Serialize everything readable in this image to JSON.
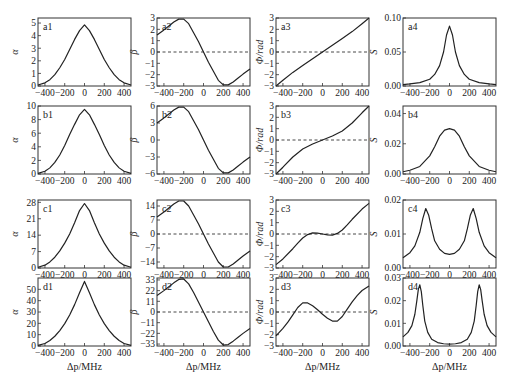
{
  "figure": {
    "xlabel": "Δp/MHz",
    "x_ticks": [
      -400,
      -200,
      0,
      200,
      400
    ],
    "x_tick_labels": [
      "−400",
      "−200",
      "0",
      "200",
      "400"
    ],
    "xlim": [
      -470,
      470
    ],
    "line_color": "#222222",
    "dash_color": "#333333"
  },
  "chart_data": [
    {
      "id": "a1",
      "type": "line",
      "row": 0,
      "col": 0,
      "label": "a1",
      "ylabel": "α",
      "ylim": [
        0,
        5.4
      ],
      "y_ticks": [
        0,
        1,
        2,
        3,
        4,
        5
      ],
      "y_tick_labels": [
        "0",
        "1",
        "2",
        "3",
        "4",
        "5"
      ],
      "zero_line": false,
      "x": [
        -470,
        -400,
        -350,
        -300,
        -250,
        -200,
        -150,
        -100,
        -50,
        0,
        50,
        100,
        150,
        200,
        250,
        300,
        350,
        400,
        470
      ],
      "y": [
        0.08,
        0.25,
        0.5,
        0.9,
        1.45,
        2.1,
        2.9,
        3.7,
        4.4,
        4.85,
        4.4,
        3.7,
        2.9,
        2.1,
        1.45,
        0.9,
        0.5,
        0.25,
        0.08
      ]
    },
    {
      "id": "a2",
      "type": "line",
      "row": 0,
      "col": 1,
      "label": "a2",
      "ylabel": "β",
      "ylim": [
        -3,
        3
      ],
      "y_ticks": [
        -3,
        -2,
        -1,
        0,
        1,
        2,
        3
      ],
      "y_tick_labels": [
        "−3",
        "−2",
        "−1",
        "0",
        "1",
        "2",
        "3"
      ],
      "zero_line": true,
      "x": [
        -470,
        -400,
        -350,
        -300,
        -250,
        -200,
        -150,
        -100,
        -50,
        0,
        50,
        100,
        150,
        200,
        250,
        300,
        350,
        400,
        470
      ],
      "y": [
        1.5,
        1.95,
        2.3,
        2.65,
        2.9,
        2.9,
        2.5,
        1.7,
        0.9,
        0.0,
        -0.9,
        -1.7,
        -2.5,
        -2.9,
        -2.9,
        -2.65,
        -2.3,
        -1.95,
        -1.5
      ]
    },
    {
      "id": "a3",
      "type": "line",
      "row": 0,
      "col": 2,
      "label": "a3",
      "ylabel": "Φ/rad",
      "ylim": [
        -3,
        3
      ],
      "y_ticks": [
        -3,
        -2,
        -1,
        0,
        1,
        2,
        3
      ],
      "y_tick_labels": [
        "−3",
        "−2",
        "−1",
        "0",
        "1",
        "2",
        "3"
      ],
      "zero_line": true,
      "x": [
        -470,
        -400,
        -300,
        -200,
        -100,
        0,
        100,
        200,
        300,
        400,
        470
      ],
      "y": [
        -3.0,
        -2.5,
        -1.8,
        -1.2,
        -0.6,
        0.0,
        0.6,
        1.2,
        1.8,
        2.5,
        3.0
      ]
    },
    {
      "id": "a4",
      "type": "line",
      "row": 0,
      "col": 3,
      "label": "a4",
      "ylabel": "S",
      "ylim": [
        0,
        0.1
      ],
      "y_ticks": [
        0,
        0.05,
        0.1
      ],
      "y_tick_labels": [
        "0.00",
        "0.05",
        "0.10"
      ],
      "zero_line": false,
      "x": [
        -470,
        -400,
        -300,
        -200,
        -150,
        -100,
        -60,
        -30,
        0,
        30,
        60,
        100,
        150,
        200,
        300,
        400,
        470
      ],
      "y": [
        0.002,
        0.003,
        0.005,
        0.01,
        0.017,
        0.03,
        0.05,
        0.075,
        0.088,
        0.075,
        0.05,
        0.03,
        0.017,
        0.01,
        0.005,
        0.003,
        0.002
      ]
    },
    {
      "id": "b1",
      "type": "line",
      "row": 1,
      "col": 0,
      "label": "b1",
      "ylabel": "α",
      "ylim": [
        0,
        10
      ],
      "y_ticks": [
        0,
        2,
        4,
        6,
        8,
        10
      ],
      "y_tick_labels": [
        "0",
        "2",
        "4",
        "6",
        "8",
        "10"
      ],
      "zero_line": false,
      "x": [
        -470,
        -400,
        -350,
        -300,
        -250,
        -200,
        -150,
        -100,
        -50,
        0,
        50,
        100,
        150,
        200,
        250,
        300,
        350,
        400,
        470
      ],
      "y": [
        0.1,
        0.4,
        0.9,
        1.7,
        2.8,
        4.2,
        5.8,
        7.3,
        8.7,
        9.5,
        8.7,
        7.3,
        5.8,
        4.2,
        2.8,
        1.7,
        0.9,
        0.4,
        0.1
      ]
    },
    {
      "id": "b2",
      "type": "line",
      "row": 1,
      "col": 1,
      "label": "b2",
      "ylabel": "β",
      "ylim": [
        -6,
        6
      ],
      "y_ticks": [
        -6,
        -3,
        0,
        3,
        6
      ],
      "y_tick_labels": [
        "−6",
        "−3",
        "0",
        "3",
        "6"
      ],
      "zero_line": false,
      "x": [
        -470,
        -400,
        -350,
        -300,
        -250,
        -200,
        -150,
        -100,
        -50,
        0,
        50,
        100,
        150,
        200,
        250,
        300,
        350,
        400,
        470
      ],
      "y": [
        3.0,
        3.9,
        4.6,
        5.3,
        5.8,
        5.8,
        5.0,
        3.4,
        1.8,
        0.0,
        -1.8,
        -3.4,
        -5.0,
        -5.8,
        -5.8,
        -5.3,
        -4.6,
        -3.9,
        -3.0
      ]
    },
    {
      "id": "b3",
      "type": "line",
      "row": 1,
      "col": 2,
      "label": "b3",
      "ylabel": "Φ/rad",
      "ylim": [
        -3,
        3
      ],
      "y_ticks": [
        -3,
        -2,
        -1,
        0,
        1,
        2,
        3
      ],
      "y_tick_labels": [
        "−3",
        "−2",
        "−1",
        "0",
        "1",
        "2",
        "3"
      ],
      "zero_line": true,
      "x": [
        -470,
        -400,
        -300,
        -200,
        -100,
        0,
        100,
        200,
        300,
        400,
        470
      ],
      "y": [
        -3.0,
        -2.4,
        -1.5,
        -0.8,
        -0.35,
        0.0,
        0.35,
        0.8,
        1.5,
        2.4,
        3.0
      ]
    },
    {
      "id": "b4",
      "type": "line",
      "row": 1,
      "col": 3,
      "label": "b4",
      "ylabel": "S",
      "ylim": [
        0,
        0.045
      ],
      "y_ticks": [
        0,
        0.02,
        0.04
      ],
      "y_tick_labels": [
        "0.00",
        "0.02",
        "0.04"
      ],
      "zero_line": false,
      "x": [
        -470,
        -400,
        -300,
        -200,
        -150,
        -100,
        -50,
        0,
        50,
        100,
        150,
        200,
        300,
        400,
        470
      ],
      "y": [
        0.0015,
        0.0025,
        0.005,
        0.012,
        0.018,
        0.025,
        0.029,
        0.03,
        0.029,
        0.025,
        0.018,
        0.012,
        0.005,
        0.0025,
        0.0015
      ]
    },
    {
      "id": "c1",
      "type": "line",
      "row": 2,
      "col": 0,
      "label": "c1",
      "ylabel": "α",
      "ylim": [
        0,
        29
      ],
      "y_ticks": [
        0,
        7,
        14,
        21,
        28
      ],
      "y_tick_labels": [
        "0",
        "7",
        "14",
        "21",
        "28"
      ],
      "zero_line": false,
      "x": [
        -470,
        -400,
        -350,
        -300,
        -250,
        -200,
        -150,
        -100,
        -50,
        0,
        50,
        100,
        150,
        200,
        250,
        300,
        350,
        400,
        470
      ],
      "y": [
        0.3,
        1.2,
        2.6,
        4.6,
        7.3,
        10.6,
        14.5,
        19.3,
        24.5,
        27.5,
        24.5,
        19.3,
        14.5,
        10.6,
        7.3,
        4.6,
        2.6,
        1.2,
        0.3
      ]
    },
    {
      "id": "c2",
      "type": "line",
      "row": 2,
      "col": 1,
      "label": "c2",
      "ylabel": "β",
      "ylim": [
        -17,
        17
      ],
      "y_ticks": [
        -14,
        -7,
        0,
        7,
        14
      ],
      "y_tick_labels": [
        "−14",
        "−7",
        "0",
        "7",
        "14"
      ],
      "zero_line": true,
      "x": [
        -470,
        -400,
        -350,
        -300,
        -250,
        -200,
        -150,
        -100,
        -50,
        0,
        50,
        100,
        150,
        200,
        250,
        300,
        350,
        400,
        470
      ],
      "y": [
        8.5,
        11,
        13,
        15,
        16.5,
        16.5,
        14,
        9.5,
        5,
        0,
        -5,
        -9.5,
        -14,
        -16.5,
        -16.5,
        -15,
        -13,
        -11,
        -8.5
      ]
    },
    {
      "id": "c3",
      "type": "line",
      "row": 2,
      "col": 2,
      "label": "c3",
      "ylabel": "Φ/rad",
      "ylim": [
        -3,
        3
      ],
      "y_ticks": [
        -3,
        -2,
        -1,
        0,
        1,
        2,
        3
      ],
      "y_tick_labels": [
        "−3",
        "−2",
        "−1",
        "0",
        "1",
        "2",
        "3"
      ],
      "zero_line": true,
      "x": [
        -470,
        -400,
        -300,
        -250,
        -200,
        -150,
        -100,
        -50,
        0,
        50,
        100,
        150,
        200,
        250,
        300,
        400,
        470
      ],
      "y": [
        -2.7,
        -2.2,
        -1.3,
        -0.8,
        -0.35,
        -0.05,
        0.1,
        0.08,
        0.0,
        -0.08,
        -0.1,
        0.05,
        0.35,
        0.8,
        1.3,
        2.2,
        2.7
      ]
    },
    {
      "id": "c4",
      "type": "line",
      "row": 2,
      "col": 3,
      "label": "c4",
      "ylabel": "S",
      "ylim": [
        0,
        0.02
      ],
      "y_ticks": [
        0,
        0.01,
        0.02
      ],
      "y_tick_labels": [
        "0.00",
        "0.01",
        "0.02"
      ],
      "zero_line": false,
      "x": [
        -470,
        -400,
        -350,
        -300,
        -270,
        -240,
        -210,
        -180,
        -150,
        -100,
        -50,
        0,
        50,
        100,
        150,
        180,
        210,
        240,
        270,
        300,
        350,
        400,
        470
      ],
      "y": [
        0.003,
        0.0045,
        0.0065,
        0.0105,
        0.0145,
        0.0175,
        0.0155,
        0.0115,
        0.008,
        0.0055,
        0.0043,
        0.004,
        0.0043,
        0.0055,
        0.008,
        0.0115,
        0.0155,
        0.0175,
        0.0145,
        0.0105,
        0.0065,
        0.0045,
        0.003
      ]
    },
    {
      "id": "d1",
      "type": "line",
      "row": 3,
      "col": 0,
      "label": "d1",
      "ylabel": "α",
      "ylim": [
        0,
        60
      ],
      "y_ticks": [
        0,
        10,
        20,
        30,
        40,
        50
      ],
      "y_tick_labels": [
        "0",
        "10",
        "20",
        "30",
        "40",
        "50"
      ],
      "zero_line": false,
      "x": [
        -470,
        -400,
        -350,
        -300,
        -250,
        -200,
        -150,
        -100,
        -50,
        0,
        50,
        100,
        150,
        200,
        250,
        300,
        350,
        400,
        470
      ],
      "y": [
        0.5,
        2.2,
        4.8,
        8.6,
        13.6,
        19.7,
        27.3,
        36.5,
        47,
        57,
        47,
        36.5,
        27.3,
        19.7,
        13.6,
        8.6,
        4.8,
        2.2,
        0.5
      ]
    },
    {
      "id": "d2",
      "type": "line",
      "row": 3,
      "col": 1,
      "label": "d2",
      "ylabel": "β",
      "ylim": [
        -35,
        35
      ],
      "y_ticks": [
        -33,
        -22,
        -11,
        0,
        11,
        22,
        33
      ],
      "y_tick_labels": [
        "−33",
        "−22",
        "−11",
        "0",
        "11",
        "22",
        "33"
      ],
      "zero_line": true,
      "x": [
        -470,
        -400,
        -350,
        -300,
        -250,
        -200,
        -150,
        -100,
        -50,
        0,
        50,
        100,
        150,
        200,
        250,
        300,
        350,
        400,
        470
      ],
      "y": [
        17,
        22,
        26,
        30,
        33.5,
        34,
        29,
        20,
        10,
        0,
        -10,
        -20,
        -29,
        -34,
        -33.5,
        -30,
        -26,
        -22,
        -17
      ]
    },
    {
      "id": "d3",
      "type": "line",
      "row": 3,
      "col": 2,
      "label": "d3",
      "ylabel": "Φ/rad",
      "ylim": [
        -3,
        3
      ],
      "y_ticks": [
        -3,
        -2,
        -1,
        0,
        1,
        2,
        3
      ],
      "y_tick_labels": [
        "−3",
        "−2",
        "−1",
        "0",
        "1",
        "2",
        "3"
      ],
      "zero_line": true,
      "x": [
        -470,
        -400,
        -350,
        -300,
        -250,
        -200,
        -150,
        -100,
        -50,
        0,
        50,
        100,
        150,
        200,
        250,
        300,
        350,
        400,
        470
      ],
      "y": [
        -2.1,
        -1.45,
        -0.9,
        -0.25,
        0.4,
        0.8,
        0.8,
        0.55,
        0.2,
        -0.2,
        -0.55,
        -0.8,
        -0.8,
        -0.4,
        0.25,
        0.9,
        1.45,
        1.9,
        2.3
      ]
    },
    {
      "id": "d4",
      "type": "line",
      "row": 3,
      "col": 3,
      "label": "d4",
      "ylabel": "S",
      "ylim": [
        0,
        0.03
      ],
      "y_ticks": [
        0,
        0.01,
        0.02,
        0.03
      ],
      "y_tick_labels": [
        "0.00",
        "0.01",
        "0.02",
        "0.03"
      ],
      "zero_line": false,
      "x": [
        -470,
        -420,
        -380,
        -350,
        -330,
        -315,
        -300,
        -285,
        -270,
        -250,
        -220,
        -180,
        -120,
        -60,
        0,
        60,
        120,
        180,
        220,
        250,
        270,
        285,
        300,
        315,
        330,
        350,
        380,
        420,
        470
      ],
      "y": [
        0.004,
        0.006,
        0.009,
        0.014,
        0.02,
        0.025,
        0.027,
        0.024,
        0.018,
        0.011,
        0.006,
        0.003,
        0.0015,
        0.001,
        0.0008,
        0.001,
        0.0015,
        0.003,
        0.006,
        0.011,
        0.018,
        0.024,
        0.027,
        0.025,
        0.02,
        0.014,
        0.009,
        0.006,
        0.004
      ]
    }
  ]
}
